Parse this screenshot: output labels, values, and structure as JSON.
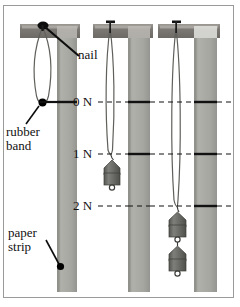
{
  "figure": {
    "background_color": "#ffffff",
    "border_color": "#9a9a9a",
    "width": 240,
    "height": 307
  },
  "colors": {
    "paper_strip": "#a9a9a4",
    "paper_strip_shade": "#8f8f8a",
    "wood_block": "#7d7a76",
    "wood_block_light": "#c9c7c2",
    "rubber_band": "#6f6f6b",
    "weight_body": "#6a6a66",
    "weight_highlight": "#8e8e8a",
    "ink": "#111111",
    "marker_dot": "#000000"
  },
  "labels": {
    "nail": "nail",
    "rubber_band_line1": "rubber",
    "rubber_band_line2": "band",
    "paper_strip_line1": "paper",
    "paper_strip_line2": "strip"
  },
  "scale": {
    "unit": "N",
    "marks": [
      {
        "id": "0n",
        "label": "0 N",
        "value": 0,
        "y": 102
      },
      {
        "id": "1n",
        "label": "1 N",
        "value": 1,
        "y": 154
      },
      {
        "id": "2n",
        "label": "2 N",
        "value": 2,
        "y": 206
      }
    ]
  },
  "setups": [
    {
      "id": "setup-1",
      "name": "unloaded-setup",
      "weights_hung": 0,
      "force_label": "0 N",
      "marker_y": 102,
      "strip_x": 57,
      "strip_width": 20
    },
    {
      "id": "setup-2",
      "name": "one-weight-setup",
      "weights_hung": 1,
      "force_label": "1 N",
      "marker_y": 154,
      "strip_x": 128,
      "strip_width": 22
    },
    {
      "id": "setup-3",
      "name": "two-weight-setup",
      "weights_hung": 2,
      "force_label": "2 N",
      "marker_y": 206,
      "strip_x": 194,
      "strip_width": 23
    }
  ]
}
